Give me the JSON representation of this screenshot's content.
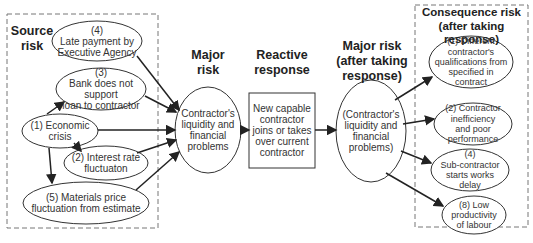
{
  "headers": {
    "source_risk": "Source\nrisk",
    "major_risk": "Major\nrisk",
    "reactive_response": "Reactive\nresponse",
    "major_risk_after": "Major risk\n(after taking\nresponse)",
    "consequence_risk": "Consequence risk\n(after taking response)"
  },
  "source_risks": [
    {
      "id": "4",
      "label": "(4)\nLate payment by\nExecutive Agency"
    },
    {
      "id": "3",
      "label": "(3)\nBank does not support\nloan to contractor"
    },
    {
      "id": "1",
      "label": "(1) Economic\ncrisis"
    },
    {
      "id": "2",
      "label": "(2) Interest rate\nfluctuaton"
    },
    {
      "id": "5",
      "label": "(5) Materials price\nfluctuation from estimate"
    }
  ],
  "major_risk": {
    "label": "Contractor's\nliquidity and\nfinancial\nproblems"
  },
  "reactive_response": {
    "label": "New capable\ncontractor\njoins or takes\nover current\ncontractor"
  },
  "major_risk_after": {
    "label": "(Contractor's\nliquidity and\nfinancial\nproblems)"
  },
  "consequence_risks": [
    {
      "id": "1",
      "label": "(1) Different\ncontractor's\nqualifications from\nspecified in\ncontract"
    },
    {
      "id": "2",
      "label": "(2) Contractor\ninefficiency\nand poor\nperformance"
    },
    {
      "id": "4",
      "label": "(4)\nSub-contractor\nstarts works\ndelay"
    },
    {
      "id": "8",
      "label": "(8) Low\nproductivity\nof labour"
    }
  ],
  "colors": {
    "line": "#222222",
    "dash": "#777777",
    "text": "#333333"
  }
}
